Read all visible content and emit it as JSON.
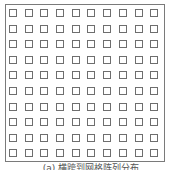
{
  "figure": {
    "grid": {
      "rows": 10,
      "cols": 10,
      "cell_shape": "square-outline",
      "stroke_color": "#6e6e6e",
      "frame_color": "#7a7a7a"
    },
    "caption": "(a) 横跨到网格阵列分布"
  }
}
